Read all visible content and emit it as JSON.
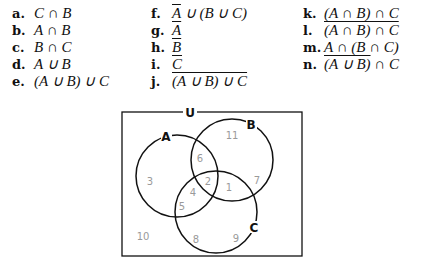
{
  "exercises": {
    "col1": [
      {
        "label": "a.",
        "expr": "C ∩ B",
        "overline": "none"
      },
      {
        "label": "b.",
        "expr": "A ∩ B",
        "overline": "none"
      },
      {
        "label": "c.",
        "expr": "B ∩ C",
        "overline": "none"
      },
      {
        "label": "d.",
        "expr": "A ∪ B",
        "overline": "none"
      },
      {
        "label": "e.",
        "expr": "(A ∪ B) ∪ C",
        "overline": "none"
      }
    ],
    "col2": [
      {
        "label": "f.",
        "expr_pre": "A",
        "expr_post": " ∪ (B ∪ C)",
        "overline": "A only"
      },
      {
        "label": "g.",
        "expr": "A",
        "overline": "all"
      },
      {
        "label": "h.",
        "expr": "B",
        "overline": "all"
      },
      {
        "label": "i.",
        "expr": "C",
        "overline": "all"
      },
      {
        "label": "j.",
        "expr": "(A ∪ B) ∪ C",
        "overline": "all"
      }
    ],
    "col3": [
      {
        "label": "k.",
        "expr": "(A ∩ B) ∩ C",
        "overline": "none"
      },
      {
        "label": "l.",
        "expr": "(A ∩ B) ∩ C",
        "overline": "all"
      },
      {
        "label": "m.",
        "expr_pre": "A ∩ (B ∩ C)",
        "expr_post": "",
        "overline": "A ∩ (B ∩ C) upper bar to B∩C"
      },
      {
        "label": "n.",
        "expr_pre": "(A ∪ B)",
        "expr_post": " ∩ C",
        "overline": "(A ∪ B) only"
      }
    ]
  },
  "venn": {
    "universe_label": "U",
    "sets": [
      {
        "name": "A",
        "cx": 177,
        "cy": 176,
        "r": 41
      },
      {
        "name": "B",
        "cx": 232,
        "cy": 160,
        "r": 41
      },
      {
        "name": "C",
        "cx": 216,
        "cy": 212,
        "r": 41
      }
    ],
    "regions": [
      {
        "value": "11",
        "x": 232,
        "y": 139
      },
      {
        "value": "6",
        "x": 200,
        "y": 162
      },
      {
        "value": "3",
        "x": 150,
        "y": 185
      },
      {
        "value": "2",
        "x": 208,
        "y": 185
      },
      {
        "value": "1",
        "x": 229,
        "y": 191
      },
      {
        "value": "7",
        "x": 257,
        "y": 184
      },
      {
        "value": "4",
        "x": 193,
        "y": 196
      },
      {
        "value": "5",
        "x": 182,
        "y": 210
      },
      {
        "value": "10",
        "x": 143,
        "y": 240
      },
      {
        "value": "8",
        "x": 196,
        "y": 243
      },
      {
        "value": "9",
        "x": 236,
        "y": 242
      }
    ],
    "colors": {
      "stroke": "#111111",
      "region_text": "#9a9a9a"
    }
  }
}
